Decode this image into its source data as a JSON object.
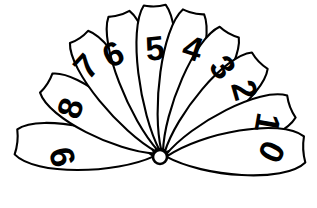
{
  "figure": {
    "type": "line-drawing",
    "background_color": "#ffffff",
    "stroke_color": "#000000",
    "digit_color": "#000000",
    "canvas": {
      "width": 317,
      "height": 208
    },
    "hub": {
      "cx": 160,
      "cy": 157,
      "r": 7
    }
  },
  "petals": [
    {
      "label": "9",
      "name": "petal-9",
      "angle_deg": 186,
      "length": 142,
      "half_width": 30,
      "digit": {
        "x": 62,
        "y": 157,
        "rotate": -104,
        "size": 34
      }
    },
    {
      "label": "8",
      "name": "petal-8",
      "angle_deg": 213,
      "length": 133,
      "half_width": 27,
      "digit": {
        "x": 70,
        "y": 108,
        "rotate": -72,
        "size": 34
      }
    },
    {
      "label": "7",
      "name": "petal-7",
      "angle_deg": 236,
      "length": 142,
      "half_width": 26,
      "digit": {
        "x": 86,
        "y": 66,
        "rotate": -48,
        "size": 34
      }
    },
    {
      "label": "6",
      "name": "petal-6",
      "angle_deg": 254,
      "length": 146,
      "half_width": 26,
      "digit": {
        "x": 113,
        "y": 54,
        "rotate": -28,
        "size": 34
      }
    },
    {
      "label": "5",
      "name": "petal-5",
      "angle_deg": 268,
      "length": 149,
      "half_width": 26,
      "digit": {
        "x": 155,
        "y": 48,
        "rotate": -6,
        "size": 36
      }
    },
    {
      "label": "4",
      "name": "petal-4",
      "angle_deg": 283,
      "length": 146,
      "half_width": 26,
      "digit": {
        "x": 193,
        "y": 48,
        "rotate": 18,
        "size": 36
      }
    },
    {
      "label": "3",
      "name": "petal-3",
      "angle_deg": 299,
      "length": 140,
      "half_width": 26,
      "digit": {
        "x": 223,
        "y": 67,
        "rotate": 52,
        "size": 34
      }
    },
    {
      "label": "2",
      "name": "petal-2",
      "angle_deg": 316,
      "length": 136,
      "half_width": 27,
      "digit": {
        "x": 245,
        "y": 90,
        "rotate": 74,
        "size": 34
      }
    },
    {
      "label": "1",
      "name": "petal-1",
      "angle_deg": 339,
      "length": 138,
      "half_width": 28,
      "digit": {
        "x": 268,
        "y": 123,
        "rotate": 100,
        "size": 32
      }
    },
    {
      "label": "0",
      "name": "petal-0",
      "angle_deg": 357,
      "length": 142,
      "half_width": 31,
      "digit": {
        "x": 272,
        "y": 152,
        "rotate": 116,
        "size": 34
      }
    }
  ]
}
